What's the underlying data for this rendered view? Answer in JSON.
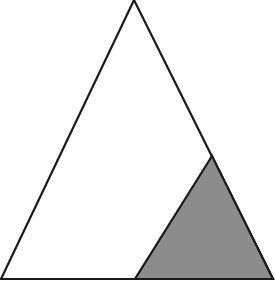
{
  "diagram": {
    "type": "geometry",
    "outer_triangle": {
      "vertices": [
        [
          134,
          0
        ],
        [
          1,
          279
        ],
        [
          273,
          279
        ]
      ],
      "fill": "#ffffff",
      "stroke": "#1a1a1a"
    },
    "shaded_triangle": {
      "vertices": [
        [
          212,
          156
        ],
        [
          135,
          279
        ],
        [
          273,
          279
        ]
      ],
      "fill": "#8c8c8c",
      "stroke": "#1a1a1a"
    },
    "colors": {
      "background": "#ffffff",
      "line": "#1a1a1a",
      "shade": "#8c8c8c"
    }
  }
}
